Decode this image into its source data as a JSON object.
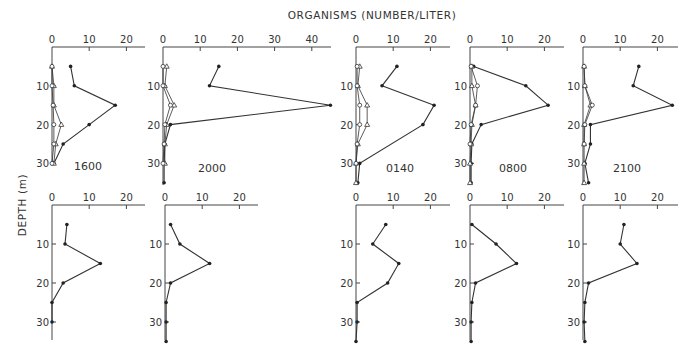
{
  "figure": {
    "top_label": "ORGANISMS (NUMBER/LITER)",
    "y_label": "DEPTH (m)"
  },
  "chart_data": [
    {
      "type": "line",
      "panel": "top-1",
      "label": "1600",
      "xlabel": "ORGANISMS (NUMBER/LITER)",
      "ylabel": "DEPTH (m)",
      "xlim": [
        0,
        25
      ],
      "xticks": [
        0,
        10,
        20
      ],
      "ylim": [
        0,
        33
      ],
      "yticks": [
        10,
        20,
        30
      ],
      "series": [
        {
          "name": "filled",
          "marker": "dot",
          "depth": [
            5,
            10,
            15,
            20,
            25,
            30
          ],
          "values": [
            5,
            6,
            17,
            10,
            3,
            0.5
          ]
        },
        {
          "name": "open-triangle",
          "marker": "triangle",
          "depth": [
            5,
            10,
            15,
            20,
            25,
            30
          ],
          "values": [
            0,
            0.5,
            0.5,
            2.5,
            1,
            0.5
          ]
        },
        {
          "name": "open-circle",
          "marker": "circle",
          "depth": [
            5,
            10,
            15,
            20,
            25,
            30
          ],
          "values": [
            0,
            0,
            0.3,
            0.5,
            0.5,
            0
          ]
        }
      ]
    },
    {
      "type": "line",
      "panel": "top-2",
      "label": "2000",
      "xlim": [
        0,
        45
      ],
      "xticks": [
        0,
        10,
        20,
        30,
        40
      ],
      "ylim": [
        0,
        35
      ],
      "yticks": [
        10,
        20,
        30
      ],
      "series": [
        {
          "name": "filled",
          "marker": "dot",
          "depth": [
            5,
            10,
            15,
            20,
            25,
            30,
            35
          ],
          "values": [
            15,
            12.5,
            45,
            2,
            0.5,
            0.3,
            0.3
          ]
        },
        {
          "name": "open-triangle",
          "marker": "triangle",
          "depth": [
            5,
            10,
            15,
            20,
            25,
            30
          ],
          "values": [
            1,
            0.5,
            3,
            1,
            0.5,
            0.5
          ]
        },
        {
          "name": "open-circle",
          "marker": "circle",
          "depth": [
            5,
            10,
            15,
            20,
            25,
            30
          ],
          "values": [
            0,
            0,
            2,
            0.5,
            0.3,
            0
          ]
        }
      ]
    },
    {
      "type": "line",
      "panel": "top-3",
      "label": "0140",
      "xlim": [
        0,
        24
      ],
      "xticks": [
        0,
        10,
        20
      ],
      "ylim": [
        0,
        35
      ],
      "yticks": [
        10,
        20,
        30
      ],
      "series": [
        {
          "name": "filled",
          "marker": "dot",
          "depth": [
            5,
            10,
            15,
            20,
            30,
            35
          ],
          "values": [
            11,
            7,
            21,
            18,
            1,
            0.5
          ]
        },
        {
          "name": "open-triangle",
          "marker": "triangle",
          "depth": [
            5,
            10,
            15,
            20,
            25,
            30,
            35
          ],
          "values": [
            1,
            0.5,
            3,
            3,
            0.5,
            0,
            0
          ]
        },
        {
          "name": "open-circle",
          "marker": "circle",
          "depth": [
            5,
            10,
            15,
            20,
            25,
            30
          ],
          "values": [
            0.3,
            0.3,
            1,
            1,
            0.3,
            0
          ]
        }
      ]
    },
    {
      "type": "line",
      "panel": "top-4",
      "label": "0800",
      "xlim": [
        0,
        24
      ],
      "xticks": [
        0,
        10,
        20
      ],
      "ylim": [
        0,
        35
      ],
      "yticks": [
        10,
        20,
        30
      ],
      "series": [
        {
          "name": "filled",
          "marker": "dot",
          "depth": [
            5,
            10,
            15,
            20,
            25,
            30,
            35
          ],
          "values": [
            1,
            15,
            21,
            3,
            0.5,
            0.3,
            0.3
          ]
        },
        {
          "name": "open-triangle",
          "marker": "triangle",
          "depth": [
            5,
            10,
            15,
            20,
            25,
            30,
            35
          ],
          "values": [
            0.5,
            0.5,
            1.5,
            0.5,
            0.3,
            0,
            0
          ]
        },
        {
          "name": "open-circle",
          "marker": "circle",
          "depth": [
            5,
            10,
            15,
            20,
            25
          ],
          "values": [
            0.3,
            2,
            1.5,
            0.3,
            0
          ]
        }
      ]
    },
    {
      "type": "line",
      "panel": "top-5",
      "label": "2100",
      "xlim": [
        0,
        25
      ],
      "xticks": [
        0,
        10,
        20
      ],
      "ylim": [
        0,
        35
      ],
      "yticks": [
        10,
        20,
        30
      ],
      "series": [
        {
          "name": "filled",
          "marker": "dot",
          "depth": [
            5,
            10,
            15,
            20,
            25,
            30,
            35
          ],
          "values": [
            15,
            13.5,
            24,
            2,
            2,
            0.5,
            1.5
          ]
        },
        {
          "name": "open-triangle",
          "marker": "triangle",
          "depth": [
            5,
            10,
            15,
            20,
            25,
            30,
            35
          ],
          "values": [
            0.3,
            0.5,
            2,
            0.3,
            0.3,
            0.3,
            0.3
          ]
        },
        {
          "name": "open-circle",
          "marker": "circle",
          "depth": [
            5,
            10,
            15,
            20,
            25
          ],
          "values": [
            0.3,
            0.5,
            2.5,
            0.5,
            0.3
          ]
        }
      ]
    },
    {
      "type": "line",
      "panel": "bottom-1",
      "xlim": [
        0,
        25
      ],
      "xticks": [
        0,
        10,
        20
      ],
      "ylim": [
        0,
        33
      ],
      "yticks": [
        10,
        20,
        30
      ],
      "series": [
        {
          "name": "filled",
          "marker": "dot",
          "depth": [
            5,
            10,
            15,
            20,
            25,
            30
          ],
          "values": [
            4,
            3.5,
            13,
            3,
            0,
            0
          ]
        }
      ]
    },
    {
      "type": "line",
      "panel": "bottom-2",
      "xlim": [
        0,
        25
      ],
      "xticks": [
        0,
        10,
        20
      ],
      "ylim": [
        0,
        35
      ],
      "yticks": [
        10,
        20,
        30
      ],
      "series": [
        {
          "name": "filled",
          "marker": "dot",
          "depth": [
            5,
            10,
            15,
            20,
            25,
            30,
            35
          ],
          "values": [
            1.5,
            4,
            12,
            1.5,
            0.3,
            0.3,
            0.3
          ]
        }
      ]
    },
    {
      "type": "line",
      "panel": "bottom-3",
      "xlim": [
        0,
        24
      ],
      "xticks": [
        0,
        10,
        20
      ],
      "ylim": [
        0,
        35
      ],
      "yticks": [
        10,
        20,
        30
      ],
      "series": [
        {
          "name": "filled",
          "marker": "dot",
          "depth": [
            5,
            10,
            15,
            20,
            25,
            30,
            35
          ],
          "values": [
            8,
            4.5,
            11.5,
            8.5,
            0.3,
            0.3,
            0
          ]
        }
      ]
    },
    {
      "type": "line",
      "panel": "bottom-4",
      "xlim": [
        0,
        24
      ],
      "xticks": [
        0,
        10,
        20
      ],
      "ylim": [
        0,
        35
      ],
      "yticks": [
        10,
        20,
        30
      ],
      "series": [
        {
          "name": "filled",
          "marker": "dot",
          "depth": [
            5,
            10,
            15,
            20,
            25,
            30,
            35
          ],
          "values": [
            0.5,
            7,
            12.5,
            1.5,
            0.5,
            0.3,
            0.3
          ]
        }
      ]
    },
    {
      "type": "line",
      "panel": "bottom-5",
      "xlim": [
        0,
        25
      ],
      "xticks": [
        0,
        10,
        20
      ],
      "ylim": [
        0,
        35
      ],
      "yticks": [
        10,
        20,
        30
      ],
      "series": [
        {
          "name": "filled",
          "marker": "dot",
          "depth": [
            5,
            10,
            15,
            20,
            25,
            30,
            35
          ],
          "values": [
            11,
            10,
            14.5,
            1.5,
            0.5,
            0.3,
            0.5
          ]
        }
      ]
    }
  ]
}
